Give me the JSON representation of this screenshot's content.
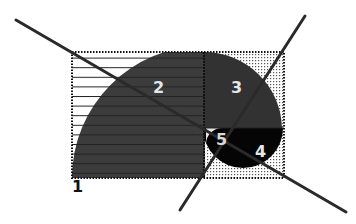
{
  "diagram": {
    "regions": [
      {
        "id": "1",
        "label": "1"
      },
      {
        "id": "2",
        "label": "2"
      },
      {
        "id": "3",
        "label": "3"
      },
      {
        "id": "4",
        "label": "4"
      },
      {
        "id": "5",
        "label": "5"
      }
    ],
    "colors": {
      "background": "#ffffff",
      "region_2": "#3c3c3c",
      "region_3": "#323232",
      "region_4": "#050505",
      "region_5": "#0a0a0a",
      "lines": "#2a2a2a",
      "label_light": "#e6e6e6",
      "label_dark": "#111111"
    }
  }
}
